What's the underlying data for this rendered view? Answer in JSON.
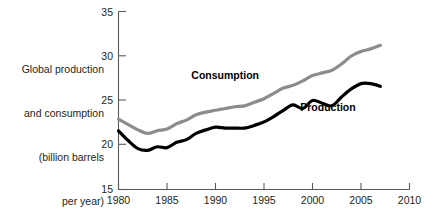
{
  "chart_data": {
    "type": "line",
    "title": "",
    "xlabel": "",
    "ylabel": "Global production and consumption (billion barrels per year)",
    "ylabel_lines": [
      "Global production",
      "and consumption",
      "(billion barrels",
      "per year)"
    ],
    "xlim": [
      1980,
      2010
    ],
    "ylim": [
      15,
      35
    ],
    "xticks": [
      1980,
      1985,
      1990,
      1995,
      2000,
      2005,
      2010
    ],
    "yticks": [
      15,
      20,
      25,
      30,
      35
    ],
    "grid": false,
    "legend_position": "inline-annotations",
    "annotations": [
      {
        "text": "Consumption",
        "x": 1991.0,
        "y": 27.4,
        "color": "#000000"
      },
      {
        "text": "Production",
        "x": 2001.6,
        "y": 23.8,
        "color": "#000000"
      }
    ],
    "x": [
      1980,
      1981,
      1982,
      1983,
      1984,
      1985,
      1986,
      1987,
      1988,
      1989,
      1990,
      1991,
      1992,
      1993,
      1994,
      1995,
      1996,
      1997,
      1998,
      1999,
      2000,
      2001,
      2002,
      2003,
      2004,
      2005,
      2006,
      2007
    ],
    "series": [
      {
        "name": "Consumption",
        "color": "#8c8c8c",
        "values": [
          22.9,
          22.3,
          21.7,
          21.3,
          21.6,
          21.8,
          22.4,
          22.8,
          23.4,
          23.7,
          23.9,
          24.1,
          24.3,
          24.4,
          24.8,
          25.2,
          25.8,
          26.4,
          26.7,
          27.2,
          27.8,
          28.1,
          28.4,
          29.1,
          30.0,
          30.5,
          30.8,
          31.2
        ]
      },
      {
        "name": "Production",
        "color": "#000000",
        "values": [
          21.6,
          20.5,
          19.6,
          19.4,
          19.8,
          19.7,
          20.3,
          20.6,
          21.3,
          21.7,
          22.0,
          21.9,
          21.9,
          21.9,
          22.2,
          22.6,
          23.2,
          23.9,
          24.5,
          24.1,
          25.0,
          24.7,
          24.4,
          25.4,
          26.3,
          26.9,
          26.9,
          26.6
        ]
      }
    ]
  },
  "axis_labels": {
    "y_ticks": [
      "15",
      "20",
      "25",
      "30",
      "35"
    ],
    "x_ticks": [
      "1980",
      "1985",
      "1990",
      "1995",
      "2000",
      "2005",
      "2010"
    ]
  },
  "colors": {
    "consumption": "#8c8c8c",
    "production": "#000000",
    "axis": "#58595b",
    "text": "#231f20",
    "background": "#ffffff"
  }
}
